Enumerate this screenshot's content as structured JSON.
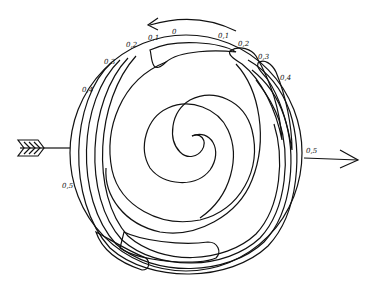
{
  "diagram": {
    "contour_labels_top": [
      "0,5",
      "0,4",
      "0,3",
      "0,2",
      "0,1",
      "0",
      "0,1",
      "0,2",
      "0,3",
      "0,4",
      "0,5"
    ],
    "labels": {
      "l_05": "0,5",
      "l_04": "0,4",
      "l_03": "0,3",
      "l_02": "0,2",
      "l_01": "0,1",
      "zero": "0",
      "r_01": "0,1",
      "r_02": "0,2",
      "r_03": "0,3",
      "r_04": "0,4",
      "r_05": "0,5"
    },
    "rotation_direction": "counter-clockwise",
    "incoming_arrow": "left (feathered arrow)",
    "outgoing_arrow": "right"
  }
}
